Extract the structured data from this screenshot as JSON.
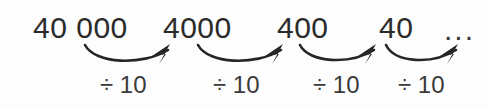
{
  "diagram": {
    "background_color": "#fdfdfd",
    "text_color": "#2b2b2b",
    "arrow_color": "#262626",
    "terms": [
      {
        "label": "40 000",
        "x": 33,
        "y": 38
      },
      {
        "label": "4000",
        "x": 163,
        "y": 38
      },
      {
        "label": "400",
        "x": 277,
        "y": 38
      },
      {
        "label": "40",
        "x": 379,
        "y": 38
      },
      {
        "label": "...",
        "x": 444,
        "y": 40
      }
    ],
    "operations": [
      {
        "label": "÷ 10",
        "x": 100,
        "y": 93
      },
      {
        "label": "÷ 10",
        "x": 213,
        "y": 93
      },
      {
        "label": "÷ 10",
        "x": 313,
        "y": 93
      },
      {
        "label": "÷ 10",
        "x": 398,
        "y": 93
      }
    ],
    "arrows": [
      {
        "name": "arrow-1",
        "path": "M 85 45 C 95 64, 142 66, 168 50"
      },
      {
        "name": "arrow-2",
        "path": "M 198 45 C 208 64, 255 66, 281 50"
      },
      {
        "name": "arrow-3",
        "path": "M 300 45 C 309 63, 350 65, 374 50"
      },
      {
        "name": "arrow-4",
        "path": "M 386 45 C 395 63, 432 65, 456 50"
      }
    ],
    "arrow_heads": [
      {
        "name": "arrow-head-1",
        "points": "170,44 152,56 166,54 159,64"
      },
      {
        "name": "arrow-head-2",
        "points": "283,44 265,56 279,54 272,64"
      },
      {
        "name": "arrow-head-3",
        "points": "376,44 358,56 372,54 365,64"
      },
      {
        "name": "arrow-head-4",
        "points": "458,44 440,56 454,54 447,64"
      }
    ]
  }
}
